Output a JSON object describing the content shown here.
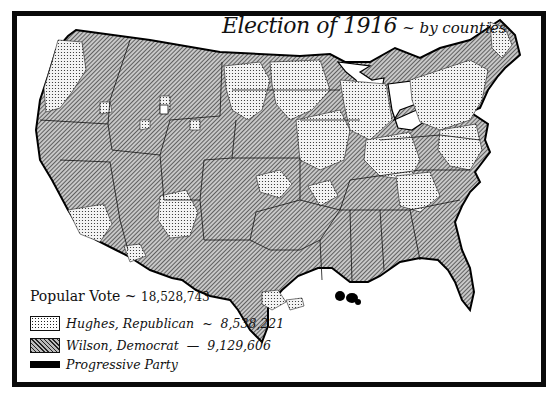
{
  "map": {
    "title": "Election of 1916",
    "subtitle": "~ by counties",
    "region": "United States",
    "unit": "counties"
  },
  "legend": {
    "header_label": "Popular Vote",
    "header_sep": "~",
    "header_value": "18,528,743",
    "entries": [
      {
        "label": "Hughes, Republican",
        "sep": "~",
        "value": "8,538,221",
        "pattern": "dotted",
        "color": "#f2f2f2"
      },
      {
        "label": "Wilson, Democrat",
        "sep": "—",
        "value": "9,129,606",
        "pattern": "diagonal-hatch",
        "color": "#8a8a8a"
      },
      {
        "label": "Progressive Party",
        "sep": "",
        "value": "",
        "pattern": "solid",
        "color": "#000000"
      }
    ]
  },
  "colors": {
    "frame": "#0a0a0a",
    "background": "#ffffff",
    "republican_fill": "#f2f2f2",
    "democrat_fill": "#8a8a8a",
    "progressive_fill": "#000000"
  }
}
